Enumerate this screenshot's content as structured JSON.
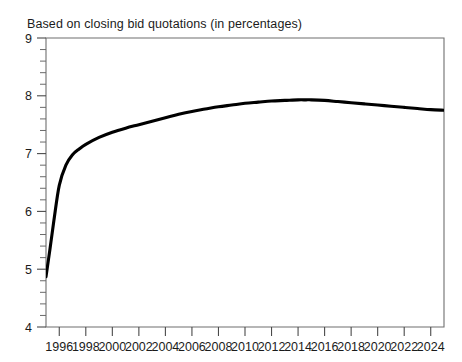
{
  "chart_data": {
    "type": "line",
    "title": "Based on closing bid quotations (in percentages)",
    "xlabel": "",
    "ylabel": "",
    "xlim": [
      1995,
      2025
    ],
    "ylim": [
      4,
      9
    ],
    "grid": false,
    "legend": null,
    "y_ticks": [
      4,
      5,
      6,
      7,
      8,
      9
    ],
    "y_tick_labels": [
      "4",
      "5",
      "6",
      "7",
      "8",
      "9"
    ],
    "y_minor_tick_step": 0.2,
    "x_ticks": [
      1996,
      1998,
      2000,
      2002,
      2004,
      2006,
      2008,
      2010,
      2012,
      2014,
      2016,
      2018,
      2020,
      2022,
      2024
    ],
    "x_tick_labels": [
      "1996",
      "1998",
      "2000",
      "2002",
      "2004",
      "2006",
      "2008",
      "2010",
      "2012",
      "2014",
      "2016",
      "2018",
      "2020",
      "2022",
      "2024"
    ],
    "series": [
      {
        "name": "closing bid quotation",
        "color": "#000000",
        "x": [
          1995.0,
          1995.3,
          1995.6,
          1996.0,
          1996.5,
          1997.0,
          1997.5,
          1998.0,
          1999.0,
          2000.0,
          2001.0,
          2002.0,
          2003.0,
          2004.0,
          2005.0,
          2006.0,
          2007.0,
          2008.0,
          2009.0,
          2010.0,
          2011.0,
          2012.0,
          2013.0,
          2014.0,
          2014.6,
          2015.0,
          2016.0,
          2017.0,
          2018.0,
          2019.0,
          2020.0,
          2021.0,
          2022.0,
          2023.0,
          2024.0,
          2025.0
        ],
        "y": [
          4.87,
          5.35,
          5.85,
          6.45,
          6.8,
          6.98,
          7.08,
          7.16,
          7.28,
          7.37,
          7.44,
          7.5,
          7.56,
          7.62,
          7.68,
          7.73,
          7.77,
          7.81,
          7.84,
          7.87,
          7.89,
          7.91,
          7.92,
          7.93,
          7.93,
          7.93,
          7.92,
          7.9,
          7.88,
          7.86,
          7.84,
          7.82,
          7.8,
          7.78,
          7.76,
          7.75
        ]
      }
    ]
  },
  "axes": {
    "y_axis_name": "y-axis",
    "x_axis_name": "x-axis"
  }
}
